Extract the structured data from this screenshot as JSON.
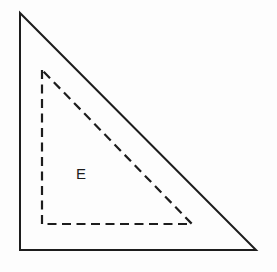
{
  "figure": {
    "title": "Right triangle with inscribed dashed right triangle labeled E",
    "background_color": "#fdfdfd",
    "stroke_color": "#1d1d1d",
    "outer_triangle": {
      "name": "solid-right-triangle",
      "style": "solid",
      "stroke_width": 2,
      "points": "20,13 20,250 256,250",
      "vertices": [
        {
          "label": "top-left-apex",
          "x": 20,
          "y": 13
        },
        {
          "label": "bottom-left-right-angle",
          "x": 20,
          "y": 250
        },
        {
          "label": "bottom-right",
          "x": 256,
          "y": 250
        }
      ]
    },
    "inner_triangle": {
      "name": "dashed-right-triangle",
      "style": "dashed",
      "stroke_width": 2.2,
      "dash_length": 9,
      "gap_length": 5.5,
      "points": "42,70 42,224 192,224",
      "vertices": [
        {
          "label": "top-apex",
          "x": 42,
          "y": 70
        },
        {
          "label": "bottom-left-right-angle",
          "x": 42,
          "y": 224
        },
        {
          "label": "bottom-right",
          "x": 192,
          "y": 224
        }
      ]
    },
    "labels": [
      {
        "name": "region-label-e",
        "text": "E",
        "x": 81,
        "y": 179,
        "font_size": 15
      }
    ]
  }
}
